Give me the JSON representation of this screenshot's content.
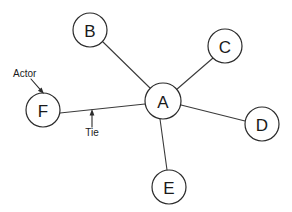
{
  "diagram": {
    "type": "node-link-graph",
    "canvas": {
      "width": 292,
      "height": 212
    },
    "style": {
      "background_color": "#ffffff",
      "node_fill": "#ffffff",
      "node_stroke": "#2b2b2b",
      "edge_color": "#3a3a3a",
      "text_color": "#1a1a1a"
    },
    "nodes": [
      {
        "id": "A",
        "label": "A",
        "cx": 163,
        "cy": 101,
        "r": 18
      },
      {
        "id": "B",
        "label": "B",
        "cx": 90,
        "cy": 30,
        "r": 17
      },
      {
        "id": "C",
        "label": "C",
        "cx": 225,
        "cy": 46,
        "r": 17
      },
      {
        "id": "D",
        "label": "D",
        "cx": 262,
        "cy": 124,
        "r": 17
      },
      {
        "id": "E",
        "label": "E",
        "cx": 169,
        "cy": 187,
        "r": 17
      },
      {
        "id": "F",
        "label": "F",
        "cx": 43,
        "cy": 110,
        "r": 17
      }
    ],
    "edges": [
      {
        "from": "A",
        "to": "B",
        "x1": 150,
        "y1": 88,
        "x2": 103,
        "y2": 42
      },
      {
        "from": "A",
        "to": "C",
        "x1": 176,
        "y1": 90,
        "x2": 213,
        "y2": 58
      },
      {
        "from": "A",
        "to": "D",
        "x1": 181,
        "y1": 105,
        "x2": 245,
        "y2": 121
      },
      {
        "from": "A",
        "to": "E",
        "x1": 160,
        "y1": 119,
        "x2": 167,
        "y2": 170
      },
      {
        "from": "A",
        "to": "F",
        "x1": 145,
        "y1": 104,
        "x2": 60,
        "y2": 113
      }
    ],
    "annotations": [
      {
        "id": "actor",
        "label": "Actor",
        "label_x": 13,
        "label_y": 77,
        "points_to": "F",
        "arrow": {
          "x1": 31,
          "y1": 79,
          "x2": 44,
          "y2": 94
        }
      },
      {
        "id": "tie",
        "label": "Tie",
        "label_x": 92,
        "label_y": 136,
        "points_to": "A-F edge",
        "arrow": {
          "x1": 92,
          "y1": 127,
          "x2": 92,
          "y2": 109
        }
      }
    ]
  }
}
